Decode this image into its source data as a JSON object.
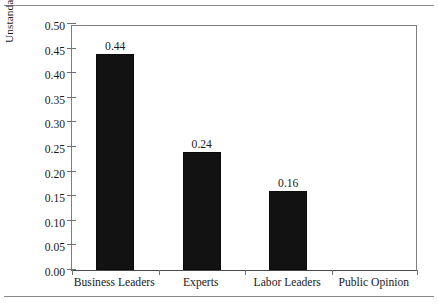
{
  "figure": {
    "background_color": "#ffffff",
    "bar_color": "#121212",
    "axis_color": "#6f6f6f",
    "rule_color": "#8a8a8a"
  },
  "chart_data": {
    "type": "bar",
    "title": "",
    "subtitle": "",
    "xlabel": "",
    "ylabel": "Unstandardized OLS Regression Coefficients",
    "categories": [
      "Business Leaders",
      "Experts",
      "Labor Leaders",
      "Public Opinion"
    ],
    "values": [
      0.44,
      0.24,
      0.16,
      0.0
    ],
    "value_labels": [
      "0.44",
      "0.24",
      "0.16",
      ""
    ],
    "ylim": [
      0.0,
      0.5
    ],
    "ytick_values": [
      0.0,
      0.05,
      0.1,
      0.15,
      0.2,
      0.25,
      0.3,
      0.35,
      0.4,
      0.45,
      0.5
    ],
    "ytick_labels": [
      "0.00",
      "0.05",
      "0.10",
      "0.15",
      "0.20",
      "0.25",
      "0.30",
      "0.35",
      "0.40",
      "0.45",
      "0.50"
    ],
    "ytick_step": 0.05,
    "grid": false,
    "legend": null,
    "legend_position": "none"
  }
}
